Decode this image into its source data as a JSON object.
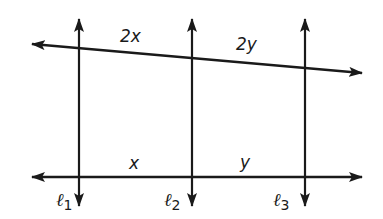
{
  "diagram": {
    "type": "transversals-and-parallel-lines",
    "stroke_color": "#1a1a1a",
    "background": "#ffffff",
    "lines": {
      "top_transversal": {
        "x1": 32,
        "y1": 44,
        "x2": 362,
        "y2": 73,
        "arrows": "both"
      },
      "bottom_transversal": {
        "x1": 32,
        "y1": 177,
        "x2": 362,
        "y2": 177,
        "arrows": "both"
      },
      "parallel": [
        {
          "name": "l1",
          "x": 79,
          "y1": 19,
          "y2": 206
        },
        {
          "name": "l2",
          "x": 192,
          "y1": 19,
          "y2": 206
        },
        {
          "name": "l3",
          "x": 305,
          "y1": 19,
          "y2": 206
        }
      ]
    },
    "segment_labels": {
      "top_left": "2x",
      "top_right": "2y",
      "bottom_left": "x",
      "bottom_right": "y"
    },
    "line_labels": {
      "l1": {
        "script": "ℓ",
        "sub": "1"
      },
      "l2": {
        "script": "ℓ",
        "sub": "2"
      },
      "l3": {
        "script": "ℓ",
        "sub": "3"
      }
    }
  }
}
